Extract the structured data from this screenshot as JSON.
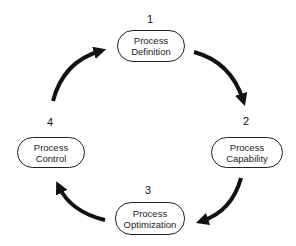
{
  "diagram": {
    "type": "cycle",
    "direction": "clockwise",
    "nodes": [
      {
        "number": "1",
        "line1": "Process",
        "line2": "Definition"
      },
      {
        "number": "2",
        "line1": "Process",
        "line2": "Capability"
      },
      {
        "number": "3",
        "line1": "Process",
        "line2": "Optimization"
      },
      {
        "number": "4",
        "line1": "Process",
        "line2": "Control"
      }
    ],
    "edges": [
      {
        "from": "1",
        "to": "2"
      },
      {
        "from": "2",
        "to": "3"
      },
      {
        "from": "3",
        "to": "4"
      },
      {
        "from": "4",
        "to": "1"
      }
    ],
    "colors": {
      "arrow": "#111111",
      "border": "#222222",
      "background": "#ffffff"
    }
  }
}
